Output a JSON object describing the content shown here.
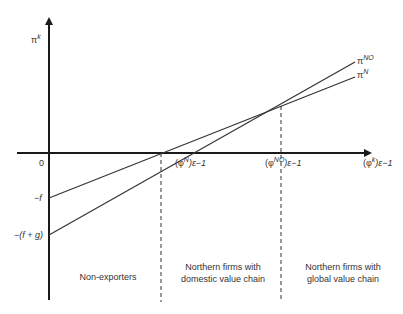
{
  "diagram": {
    "y_axis_label": {
      "base": "π",
      "sup": "k"
    },
    "x_axis_end_label": {
      "base": "(φ",
      "sup": "k",
      "tail": ")ε−1"
    },
    "origin_label": "0",
    "intercepts": {
      "minus_f": "−f",
      "minus_f_plus_g": "−(f + g)"
    },
    "thresholds": [
      {
        "id": "phi_N",
        "base": "(φ",
        "sup": "N",
        "tail": ")ε−1"
      },
      {
        "id": "phi_NO",
        "base": "(φ",
        "sup": "NO",
        "tail": ")ε−1"
      }
    ],
    "lines": [
      {
        "id": "pi_NO",
        "base": "π",
        "sup": "NO",
        "intercept": "−(f + g)",
        "slope": "steeper"
      },
      {
        "id": "pi_N",
        "base": "π",
        "sup": "N",
        "intercept": "−f",
        "slope": "flatter"
      }
    ],
    "regions": [
      {
        "id": "non-exporters",
        "text": "Non-exporters"
      },
      {
        "id": "domestic",
        "text": "Northern firms with domestic value chain"
      },
      {
        "id": "global",
        "text": "Northern firms with global value chain"
      }
    ],
    "colors": {
      "line": "#333333",
      "axis": "#1a1a1a",
      "background": "#ffffff"
    }
  }
}
